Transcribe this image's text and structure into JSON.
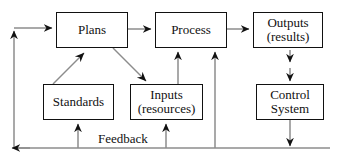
{
  "diagram": {
    "type": "flowchart",
    "colors": {
      "box_border": "#111111",
      "box_fill": "#ffffff",
      "connector": "#8c8c8c",
      "arrowhead": "#111111",
      "text": "#111111",
      "background": "#ffffff"
    },
    "nodes": [
      {
        "id": "plans",
        "lines": [
          "Plans"
        ],
        "x": 56,
        "y": 12,
        "w": 72,
        "h": 36,
        "font_size": 13
      },
      {
        "id": "process",
        "lines": [
          "Process"
        ],
        "x": 155,
        "y": 12,
        "w": 72,
        "h": 36,
        "font_size": 13
      },
      {
        "id": "outputs",
        "lines": [
          "Outputs",
          "(results)"
        ],
        "x": 253,
        "y": 12,
        "w": 70,
        "h": 36,
        "font_size": 13
      },
      {
        "id": "standards",
        "lines": [
          "Standards"
        ],
        "x": 43,
        "y": 84,
        "w": 71,
        "h": 36,
        "font_size": 13
      },
      {
        "id": "inputs",
        "lines": [
          "Inputs",
          "(resources)"
        ],
        "x": 130,
        "y": 84,
        "w": 73,
        "h": 36,
        "font_size": 13
      },
      {
        "id": "control_system",
        "lines": [
          "Control",
          "System"
        ],
        "x": 256,
        "y": 84,
        "w": 68,
        "h": 36,
        "font_size": 13
      }
    ],
    "edge_labels": [
      {
        "id": "feedback",
        "text": "Feedback",
        "x": 96,
        "y": 131,
        "font_size": 13
      }
    ],
    "edges": [
      {
        "id": "feedback-to-plans",
        "from": "feedback-bus",
        "to": "plans",
        "arrow": "single"
      },
      {
        "id": "plans-to-process",
        "from": "plans",
        "to": "process",
        "arrow": "single"
      },
      {
        "id": "process-to-outputs",
        "from": "process",
        "to": "outputs",
        "arrow": "single"
      },
      {
        "id": "standards-to-plans",
        "from": "standards",
        "to": "plans",
        "arrow": "single"
      },
      {
        "id": "plans-to-inputs",
        "from": "plans",
        "to": "inputs",
        "arrow": "single"
      },
      {
        "id": "inputs-to-process",
        "from": "inputs",
        "to": "process",
        "arrow": "single"
      },
      {
        "id": "feedback-to-process",
        "from": "feedback-bus",
        "to": "process",
        "arrow": "single"
      },
      {
        "id": "outputs-to-control-system",
        "from": "outputs",
        "to": "control_system",
        "arrow": "double"
      },
      {
        "id": "control-system-to-feedback",
        "from": "control_system",
        "to": "feedback-bus",
        "arrow": "single"
      },
      {
        "id": "feedback-to-standards",
        "from": "feedback-bus",
        "to": "standards",
        "arrow": "single"
      },
      {
        "id": "feedback-to-inputs",
        "from": "feedback-bus",
        "to": "inputs",
        "arrow": "single"
      },
      {
        "id": "feedback-bus-left-return",
        "from": "feedback-bus",
        "to": "left-riser",
        "arrow": "single"
      }
    ]
  }
}
